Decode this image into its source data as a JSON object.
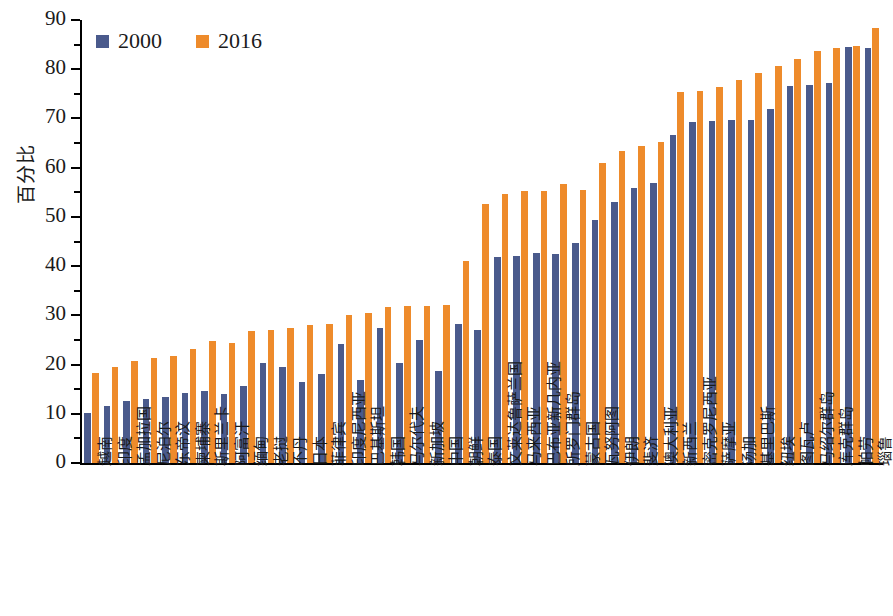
{
  "chart_data": {
    "type": "bar",
    "title": "",
    "xlabel": "",
    "ylabel": "百分比",
    "ylim": [
      0,
      90
    ],
    "yticks": [
      0,
      10,
      20,
      30,
      40,
      50,
      60,
      70,
      80,
      90
    ],
    "ytick_labels": [
      "0",
      "10",
      "20",
      "30",
      "40",
      "50",
      "60",
      "70",
      "80",
      "90"
    ],
    "grid": false,
    "legend_position": "top-left",
    "colors": {
      "series_2000": "#4a5a8c",
      "series_2016": "#ee8b2b",
      "axis": "#000000",
      "background": "#ffffff"
    },
    "categories": [
      "越南",
      "印度",
      "孟加拉国",
      "尼泊尔",
      "东帝汶",
      "柬埔寨",
      "斯里兰卡",
      "阿富汗",
      "缅甸",
      "老挝",
      "不丹",
      "日本",
      "菲律宾",
      "印度尼西亚",
      "巴基斯坦",
      "韩国",
      "马尔代夫",
      "新加坡",
      "中国",
      "朝鲜",
      "泰国",
      "文莱达鲁萨兰国",
      "马来西亚",
      "巴布亚新几内亚",
      "所罗门群岛",
      "蒙古国",
      "瓦努阿图",
      "伊朗",
      "斐济",
      "澳大利亚",
      "新西兰",
      "密克罗尼西亚",
      "萨摩亚",
      "汤加",
      "基里巴斯",
      "纽埃",
      "图瓦卢",
      "马绍尔群岛",
      "库克群岛",
      "帕劳",
      "瑙鲁"
    ],
    "series": [
      {
        "name": "2000",
        "color": "#4a5a8c",
        "values": [
          10.2,
          11.6,
          12.6,
          13.1,
          13.4,
          14.2,
          14.7,
          14.1,
          15.7,
          20.3,
          19.5,
          16.5,
          18.0,
          24.2,
          16.8,
          27.5,
          20.4,
          25.0,
          18.7,
          28.2,
          27.0,
          41.8,
          42.0,
          42.6,
          42.4,
          44.8,
          49.4,
          53.1,
          55.9,
          56.9,
          66.6,
          69.2,
          69.5,
          69.7,
          69.7,
          72.0,
          76.5,
          76.8,
          77.3,
          84.5,
          84.3
        ]
      },
      {
        "name": "2016",
        "color": "#ee8b2b",
        "values": [
          18.2,
          19.6,
          20.8,
          21.4,
          21.7,
          23.2,
          24.8,
          24.4,
          26.8,
          27.1,
          27.5,
          28.1,
          28.3,
          30.1,
          30.5,
          31.7,
          32.0,
          31.9,
          32.2,
          41.0,
          52.6,
          54.6,
          55.2,
          55.3,
          56.7,
          55.5,
          61.0,
          63.4,
          64.5,
          65.2,
          75.4,
          75.6,
          76.4,
          77.9,
          79.3,
          80.6,
          82.0,
          83.8,
          84.3,
          84.7,
          88.3
        ]
      }
    ]
  },
  "legend": {
    "items": [
      {
        "label": "2000",
        "color": "#4a5a8c",
        "swatch": "legend-swatch-blue"
      },
      {
        "label": "2016",
        "color": "#ee8b2b",
        "swatch": "legend-swatch-orange"
      }
    ]
  },
  "axes": {
    "y_title": "百分比",
    "y_tick_labels": [
      "90",
      "80",
      "70",
      "60",
      "50",
      "40",
      "30",
      "20",
      "10",
      "0"
    ]
  }
}
